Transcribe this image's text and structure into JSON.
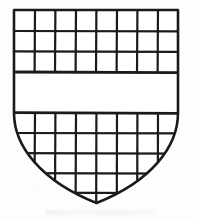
{
  "figure": {
    "title": "Heraldic shield with fretty chief and base divided by a plain fess",
    "blazon_summary": "Checky, a fess plain",
    "drawing_style": "ink line art",
    "line_color": "#1a1a1a",
    "fill_color": "#ffffff",
    "background_color": "#fdfdfc",
    "caption": ""
  },
  "shield_geometry": {
    "left_x": 14,
    "right_x": 178,
    "top_y": 10,
    "point_y": 203,
    "shoulder_y": 113,
    "center_x": 96,
    "outline_stroke_width": 2.6,
    "grid_stroke_width": 2.2
  },
  "ordinaries": [
    {
      "name": "chief-field",
      "type": "lattice",
      "label": "Upper checky field",
      "top_y": 10,
      "bottom_y": 72,
      "rows": 3,
      "columns": 8,
      "row_lines_y": [
        31,
        51
      ],
      "column_lines_x": [
        35,
        55,
        76,
        96,
        117,
        137,
        158
      ]
    },
    {
      "name": "fess",
      "type": "plain-band",
      "label": "Plain horizontal fess",
      "top_y": 72,
      "bottom_y": 113,
      "rows": 0,
      "columns": 0
    },
    {
      "name": "base-field",
      "type": "lattice",
      "label": "Lower checky field",
      "top_y": 113,
      "bottom_y": 203,
      "rows": 4,
      "columns": 8,
      "row_lines_y": [
        133,
        153,
        173,
        192
      ],
      "column_lines_x": [
        35,
        55,
        76,
        96,
        117,
        137,
        158
      ]
    }
  ],
  "counts": {
    "total_columns": 8,
    "chief_rows": 3,
    "base_rows": 4,
    "total_cells_label": "56"
  }
}
